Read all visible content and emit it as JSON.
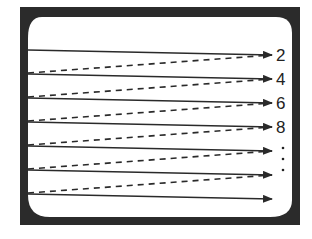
{
  "diagram": {
    "colors": {
      "bezel": "#2b2b2b",
      "screen": "#ffffff",
      "line": "#2a2a2a",
      "label": "#222222"
    },
    "scan_labels": [
      "2",
      "4",
      "6",
      "8"
    ],
    "continuation_marker": "⋮",
    "solid_scan_lines": [
      {
        "y_start": 50,
        "y_end": 55
      },
      {
        "y_start": 74,
        "y_end": 79
      },
      {
        "y_start": 98,
        "y_end": 103
      },
      {
        "y_start": 122,
        "y_end": 127
      },
      {
        "y_start": 146,
        "y_end": 151
      },
      {
        "y_start": 170,
        "y_end": 175
      },
      {
        "y_start": 194,
        "y_end": 199
      }
    ],
    "line_style": {
      "scan": "solid",
      "retrace": "dashed"
    }
  }
}
